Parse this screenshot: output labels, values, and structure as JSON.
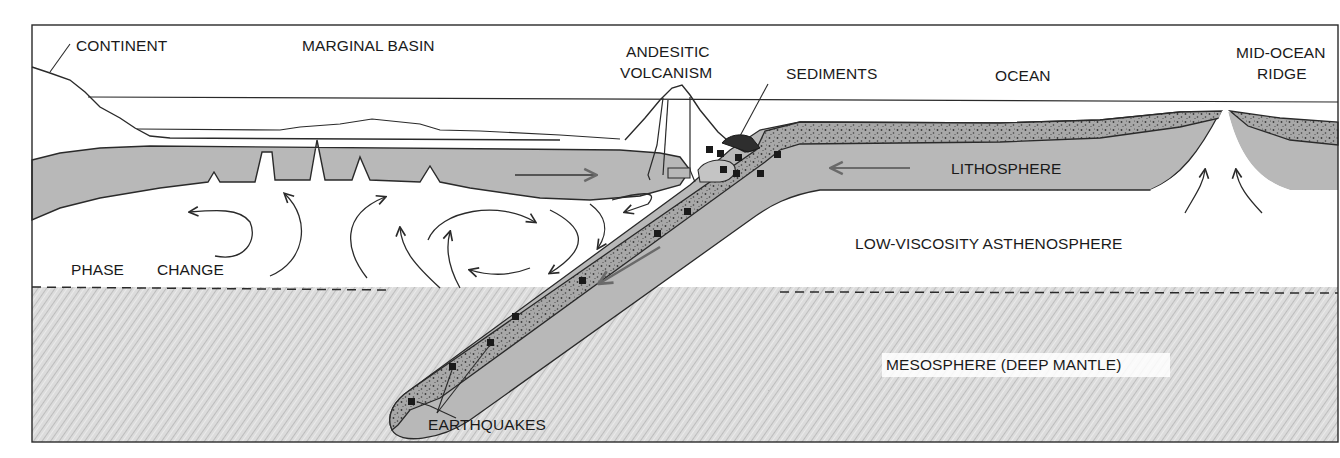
{
  "diagram": {
    "type": "geologic cross-section",
    "topic": "subduction zone and mantle convection",
    "labels": {
      "continent": "CONTINENT",
      "marginal_basin": "MARGINAL BASIN",
      "andesitic_1": "ANDESITIC",
      "andesitic_2": "VOLCANISM",
      "sediments": "SEDIMENTS",
      "ocean": "OCEAN",
      "ridge_1": "MID-OCEAN",
      "ridge_2": "RIDGE",
      "lithosphere": "LITHOSPHERE",
      "asthenosphere": "LOW-VISCOSITY ASTHENOSPHERE",
      "phase": "PHASE",
      "change": "CHANGE",
      "mesosphere": "MESOSPHERE (DEEP MANTLE)",
      "earthquakes": "EARTHQUAKES"
    },
    "colors": {
      "line": "#2a2a2a",
      "plate_fill": "#b8b8b8",
      "crust_fill": "#9a9a9a",
      "mantle_fill": "#d6d6d6",
      "sediment_fill": "#2e2e2e",
      "arrow_gray": "#6a6a6a",
      "background": "#ffffff"
    }
  }
}
